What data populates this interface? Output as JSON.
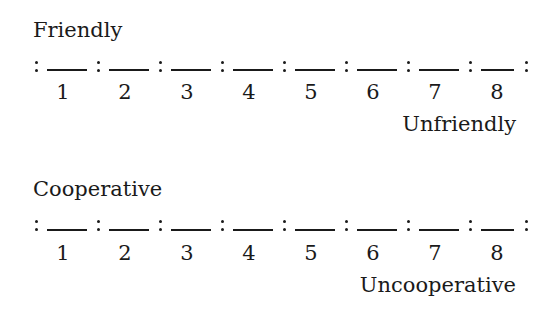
{
  "scales": [
    {
      "left_anchor": "Friendly",
      "right_anchor": "Unfriendly",
      "points": [
        "1",
        "2",
        "3",
        "4",
        "5",
        "6",
        "7",
        "8"
      ]
    },
    {
      "left_anchor": "Cooperative",
      "right_anchor": "Uncooperative",
      "points": [
        "1",
        "2",
        "3",
        "4",
        "5",
        "6",
        "7",
        "8"
      ]
    }
  ],
  "colors": {
    "text": "#1a1a1a",
    "background": "#ffffff"
  }
}
